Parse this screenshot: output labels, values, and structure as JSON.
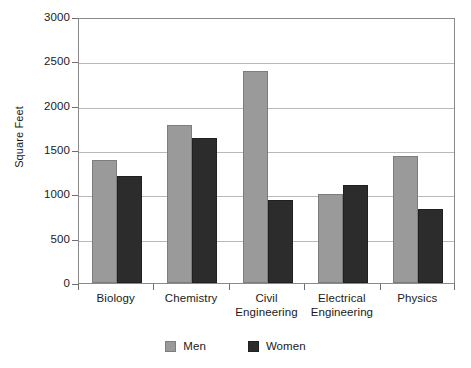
{
  "chart_data": {
    "type": "bar",
    "title": "",
    "xlabel": "",
    "ylabel": "Square Feet",
    "ylim": [
      0,
      3000
    ],
    "ytick_step": 500,
    "yticks": [
      0,
      500,
      1000,
      1500,
      2000,
      2500,
      3000
    ],
    "ytick_labels": [
      "0",
      "500",
      "1000",
      "1500",
      "2000",
      "2500",
      "3000"
    ],
    "grid": "horizontal",
    "legend_position": "bottom-center",
    "categories": [
      "Biology",
      "Chemistry",
      "Civil\nEngineering",
      "Electrical\nEngineering",
      "Physics"
    ],
    "category_labels": [
      "Biology",
      "Chemistry",
      "Civil Engineering",
      "Electrical Engineering",
      "Physics"
    ],
    "series": [
      {
        "name": "Men",
        "color": "#9a9a9a",
        "values": [
          1390,
          1780,
          2390,
          1000,
          1430
        ]
      },
      {
        "name": "Women",
        "color": "#2c2c2c",
        "values": [
          1210,
          1630,
          940,
          1100,
          830
        ]
      }
    ]
  },
  "legend": {
    "entries": [
      {
        "label": "Men",
        "swatch": "men-swatch"
      },
      {
        "label": "Women",
        "swatch": "women-swatch"
      }
    ]
  }
}
